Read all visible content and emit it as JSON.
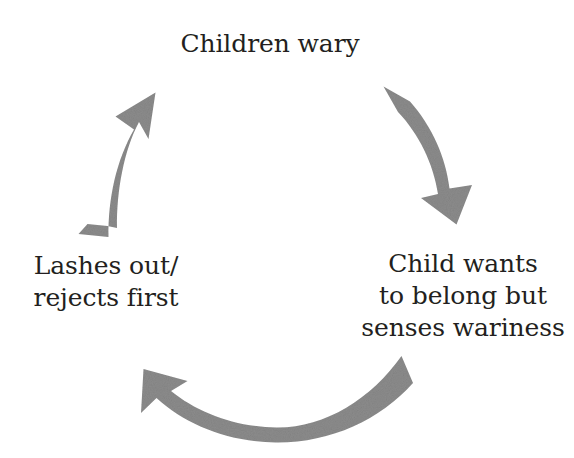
{
  "diagram": {
    "type": "cycle",
    "direction": "clockwise",
    "background_color": "#ffffff",
    "text_color": "#231f20",
    "arrow_color": "#8c8c8c",
    "nodes": [
      {
        "id": "children-wary",
        "position": "top",
        "text": "Children wary",
        "lines": [
          "Children wary"
        ]
      },
      {
        "id": "child-wants-belong",
        "position": "right",
        "text": "Child wants\nto belong but\nsenses wariness",
        "lines": [
          "Child wants",
          "to belong but",
          "senses wariness"
        ]
      },
      {
        "id": "lashes-out",
        "position": "left",
        "text": "Lashes out/\nrejects first",
        "lines": [
          "Lashes out/",
          "rejects first"
        ]
      }
    ],
    "arrows": [
      {
        "id": "arrow-top-right",
        "from": "children-wary",
        "to": "child-wants-belong",
        "direction": "down-right"
      },
      {
        "id": "arrow-bottom",
        "from": "child-wants-belong",
        "to": "lashes-out",
        "direction": "leftward"
      },
      {
        "id": "arrow-left",
        "from": "lashes-out",
        "to": "children-wary",
        "direction": "up-right"
      }
    ]
  }
}
